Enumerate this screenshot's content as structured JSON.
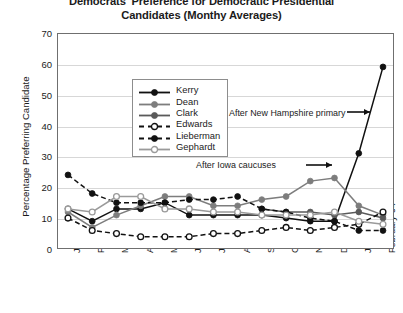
{
  "chart_data": {
    "type": "line",
    "title": "Democrats' Preference for Democratic Presidential Candidates (Monthy Averages)",
    "title_line1": "Democrats' Preference for Democratic Presidential",
    "title_line2": "Candidates (Monthy Averages)",
    "xlabel": "",
    "ylabel": "Percentage Preferring Candidate",
    "ylim": [
      0,
      70
    ],
    "yticks": [
      0,
      10,
      20,
      30,
      40,
      50,
      60,
      70
    ],
    "grid": true,
    "legend_position": "inside-top-left",
    "categories": [
      "January-03",
      "February-03",
      "March-03",
      "April-03",
      "May-03",
      "June-03",
      "July-03",
      "August-03",
      "September-03",
      "October-03",
      "November-03",
      "December-03",
      "January-04",
      "February-04"
    ],
    "series": [
      {
        "name": "Kerry",
        "color": "#111111",
        "style": "solid",
        "marker": "filled-circle",
        "values": [
          13,
          9,
          13,
          13,
          15,
          11,
          11,
          11,
          11,
          10,
          9,
          9,
          31,
          59
        ]
      },
      {
        "name": "Dean",
        "color": "#7d7d7d",
        "style": "solid",
        "marker": "filled-circle",
        "values": [
          12,
          7,
          11,
          14,
          17,
          17,
          14,
          14,
          16,
          17,
          22,
          23,
          14,
          11
        ]
      },
      {
        "name": "Clark",
        "color": "#5a5a5a",
        "style": "solid",
        "marker": "filled-circle",
        "values": [
          null,
          null,
          null,
          null,
          null,
          null,
          null,
          null,
          13,
          12,
          12,
          11,
          12,
          10
        ]
      },
      {
        "name": "Edwards",
        "color": "#111111",
        "style": "dashed",
        "marker": "open-circle",
        "values": [
          10,
          6,
          5,
          4,
          4,
          4,
          5,
          5,
          6,
          7,
          6,
          7,
          8,
          12
        ]
      },
      {
        "name": "Lieberman",
        "color": "#111111",
        "style": "dashed",
        "marker": "filled-circle",
        "values": [
          24,
          18,
          15,
          15,
          15,
          16,
          16,
          17,
          13,
          12,
          10,
          9,
          6,
          6
        ]
      },
      {
        "name": "Gephardt",
        "color": "#9a9a9a",
        "style": "solid",
        "marker": "open-circle",
        "values": [
          13,
          12,
          17,
          17,
          13,
          13,
          12,
          12,
          11,
          11,
          11,
          12,
          9,
          8
        ]
      }
    ],
    "annotations": [
      {
        "id": "after-new-hampshire-primary",
        "text": "After New Hampshire primary",
        "arrow": "right"
      },
      {
        "id": "after-iowa-caucuses",
        "text": "After Iowa caucuses",
        "arrow": "right"
      }
    ]
  },
  "legend": {
    "items": [
      {
        "label": "Kerry"
      },
      {
        "label": "Dean"
      },
      {
        "label": "Clark"
      },
      {
        "label": "Edwards"
      },
      {
        "label": "Lieberman"
      },
      {
        "label": "Gephardt"
      }
    ]
  }
}
